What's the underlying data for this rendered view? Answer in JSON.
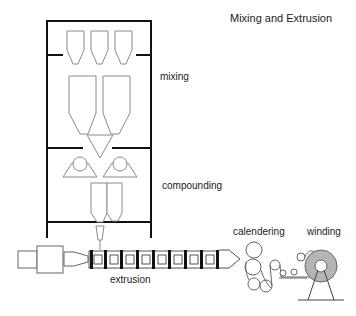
{
  "diagram": {
    "title": "Mixing and Extrusion",
    "stages": [
      {
        "id": "mixing",
        "label": "mixing"
      },
      {
        "id": "compounding",
        "label": "compounding"
      },
      {
        "id": "extrusion",
        "label": "extrusion"
      },
      {
        "id": "calendering",
        "label": "calendering"
      },
      {
        "id": "winding",
        "label": "winding"
      }
    ],
    "colors": {
      "frame": "#111111",
      "equipment_outline": "#8a8a8a",
      "barrel_outline": "#555555",
      "screw_band": "#111111",
      "roll_fill": "#b5b5b5"
    }
  }
}
